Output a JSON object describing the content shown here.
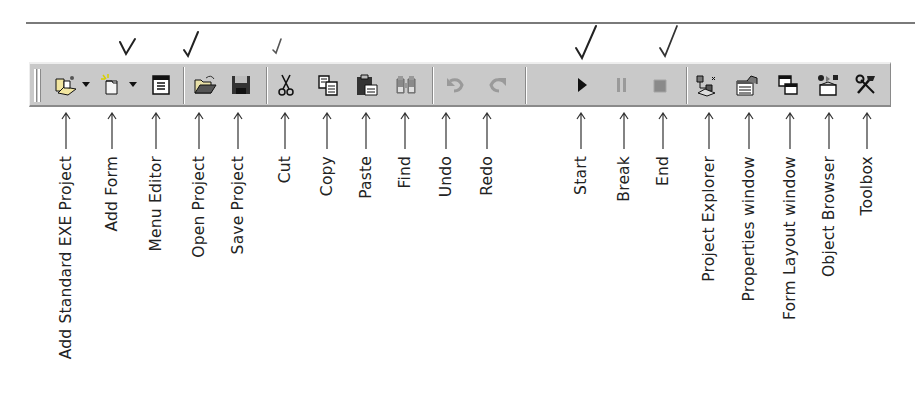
{
  "toolbar": {
    "name": "Standard toolbar",
    "background": "#c9c9c9",
    "buttons": [
      {
        "id": "add-standard-exe-project",
        "icon": "add-project-icon",
        "label": "Add Standard EXE Project",
        "has_dropdown": true,
        "checked": false,
        "enabled": true
      },
      {
        "id": "add-form",
        "icon": "add-form-icon",
        "label": "Add Form",
        "has_dropdown": true,
        "checked": true,
        "enabled": true
      },
      {
        "id": "menu-editor",
        "icon": "menu-editor-icon",
        "label": "Menu Editor",
        "has_dropdown": false,
        "checked": true,
        "enabled": true
      },
      {
        "id": "open-project",
        "icon": "open-folder-icon",
        "label": "Open Project",
        "has_dropdown": false,
        "checked": false,
        "enabled": true
      },
      {
        "id": "save-project",
        "icon": "floppy-disk-icon",
        "label": "Save Project",
        "has_dropdown": false,
        "checked": true,
        "enabled": true
      },
      {
        "id": "cut",
        "icon": "scissors-icon",
        "label": "Cut",
        "has_dropdown": false,
        "checked": false,
        "enabled": true
      },
      {
        "id": "copy",
        "icon": "copy-icon",
        "label": "Copy",
        "has_dropdown": false,
        "checked": false,
        "enabled": true
      },
      {
        "id": "paste",
        "icon": "clipboard-icon",
        "label": "Paste",
        "has_dropdown": false,
        "checked": false,
        "enabled": true
      },
      {
        "id": "find",
        "icon": "binoculars-icon",
        "label": "Find",
        "has_dropdown": false,
        "checked": false,
        "enabled": true
      },
      {
        "id": "undo",
        "icon": "undo-icon",
        "label": "Undo",
        "has_dropdown": false,
        "checked": false,
        "enabled": false
      },
      {
        "id": "redo",
        "icon": "redo-icon",
        "label": "Redo",
        "has_dropdown": false,
        "checked": false,
        "enabled": false
      },
      {
        "id": "start",
        "icon": "play-icon",
        "label": "Start",
        "has_dropdown": false,
        "checked": true,
        "enabled": true
      },
      {
        "id": "break",
        "icon": "pause-icon",
        "label": "Break",
        "has_dropdown": false,
        "checked": false,
        "enabled": false
      },
      {
        "id": "end",
        "icon": "stop-icon",
        "label": "End",
        "has_dropdown": false,
        "checked": true,
        "enabled": false
      },
      {
        "id": "project-explorer",
        "icon": "project-explorer-icon",
        "label": "Project Explorer",
        "has_dropdown": false,
        "checked": false,
        "enabled": true
      },
      {
        "id": "properties-window",
        "icon": "properties-icon",
        "label": "Properties window",
        "has_dropdown": false,
        "checked": false,
        "enabled": true
      },
      {
        "id": "form-layout-window",
        "icon": "form-layout-icon",
        "label": "Form Layout window",
        "has_dropdown": false,
        "checked": false,
        "enabled": true
      },
      {
        "id": "object-browser",
        "icon": "object-browser-icon",
        "label": "Object Browser",
        "has_dropdown": false,
        "checked": false,
        "enabled": true
      },
      {
        "id": "toolbox",
        "icon": "toolbox-icon",
        "label": "Toolbox",
        "has_dropdown": false,
        "checked": false,
        "enabled": true
      }
    ]
  }
}
